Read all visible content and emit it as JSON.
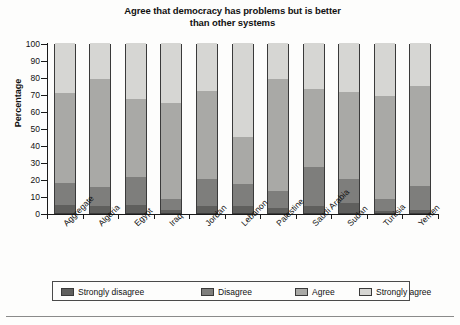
{
  "chart_data": {
    "type": "bar",
    "subtype": "stacked-vertical-100",
    "title": "Agree that democracy has problems but is better than other systems",
    "title_lines": [
      "Agree that democracy has problems but is better",
      "than other systems"
    ],
    "xlabel": "",
    "ylabel": "Percentage",
    "ylim": [
      0,
      100
    ],
    "yticks": [
      0,
      10,
      20,
      30,
      40,
      50,
      60,
      70,
      80,
      90,
      100
    ],
    "ytick_labels": [
      "0",
      "10",
      "20",
      "30",
      "40",
      "50",
      "60",
      "70",
      "80",
      "90",
      "100"
    ],
    "grid": false,
    "legend_position": "bottom",
    "categories": [
      "Aggregate",
      "Algeria",
      "Egypt",
      "Iraq",
      "Jordan",
      "Lebanon",
      "Palestine",
      "Saudi Arabia",
      "Sudan",
      "Tunisia",
      "Yemen"
    ],
    "series": [
      {
        "name": "Strongly disagree",
        "color": "#5f5f5d",
        "values": [
          4.5,
          4,
          5,
          2,
          4,
          4,
          3,
          4,
          6,
          1,
          2
        ]
      },
      {
        "name": "Disagree",
        "color": "#7e7e7c",
        "values": [
          13,
          11.5,
          16,
          6,
          16,
          13,
          10,
          23,
          14,
          7,
          14
        ]
      },
      {
        "name": "Agree",
        "color": "#a9a9a6",
        "values": [
          53,
          63.5,
          46,
          57,
          52,
          28,
          66,
          46,
          51,
          61,
          59
        ]
      },
      {
        "name": "Strongly agree",
        "color": "#d6d6d3",
        "values": [
          29.5,
          21,
          33,
          35,
          28,
          55,
          21,
          27,
          29,
          31,
          25
        ]
      }
    ],
    "cumulative_tops": {
      "Aggregate": [
        4.5,
        17.5,
        70.5,
        100
      ],
      "Algeria": [
        4,
        15.5,
        79,
        100
      ],
      "Egypt": [
        5,
        21,
        67,
        100
      ],
      "Iraq": [
        2,
        8,
        65,
        100
      ],
      "Jordan": [
        4,
        20,
        72,
        100
      ],
      "Lebanon": [
        4,
        17,
        45,
        100
      ],
      "Palestine": [
        3,
        13,
        79,
        100
      ],
      "Saudi Arabia": [
        4,
        27,
        73,
        100
      ],
      "Sudan": [
        6,
        20,
        71,
        100
      ],
      "Tunisia": [
        1,
        8,
        69,
        100
      ],
      "Yemen": [
        2,
        16,
        75,
        100
      ]
    }
  },
  "legend": {
    "items": [
      {
        "label": "Strongly disagree",
        "color": "#5f5f5d"
      },
      {
        "label": "Disagree",
        "color": "#7e7e7c"
      },
      {
        "label": "Agree",
        "color": "#a9a9a6"
      },
      {
        "label": "Strongly agree",
        "color": "#d6d6d3"
      }
    ]
  }
}
